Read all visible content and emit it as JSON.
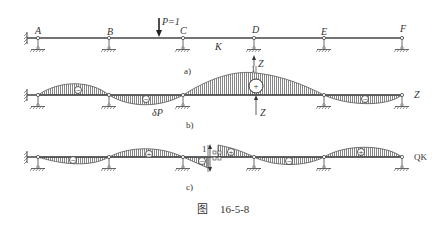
{
  "figure": {
    "caption_prefix": "图",
    "caption_number": "16-5-8"
  },
  "panel_a": {
    "sublabel": "a)",
    "load_label": "P=1",
    "section_label": "K",
    "support_labels": [
      "A",
      "B",
      "C",
      "D",
      "E",
      "F"
    ],
    "reaction_label": "Z"
  },
  "panel_b": {
    "sublabel": "b)",
    "deflection_label": "δP",
    "end_label": "Z",
    "unit_label": "1",
    "reaction_label": "Z",
    "region_signs": [
      "−",
      "−",
      "+",
      "−"
    ]
  },
  "panel_c": {
    "sublabel": "c)",
    "end_label": "QK",
    "unit_label": "1",
    "region_signs": [
      "−",
      "+",
      "−",
      "+",
      "−",
      "+"
    ]
  }
}
